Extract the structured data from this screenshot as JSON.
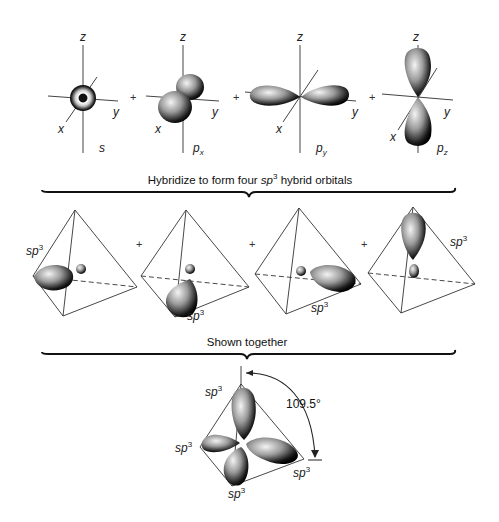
{
  "figure": {
    "row1": {
      "orbitals": [
        {
          "name": "s",
          "label": "s",
          "sub": ""
        },
        {
          "name": "px",
          "label": "p",
          "sub": "x"
        },
        {
          "name": "py",
          "label": "p",
          "sub": "y"
        },
        {
          "name": "pz",
          "label": "p",
          "sub": "z"
        }
      ],
      "axis_labels": {
        "x": "x",
        "y": "y",
        "z": "z"
      },
      "operator": "+"
    },
    "brace1": {
      "caption_pre": "Hybridize to form four ",
      "caption_sp": "sp",
      "caption_sup": "3",
      "caption_post": " hybrid orbitals"
    },
    "row2": {
      "hybrid_label": "sp",
      "hybrid_sup": "3",
      "count": 4,
      "operator": "+"
    },
    "brace2": {
      "caption": "Shown together"
    },
    "row3": {
      "hybrid_label": "sp",
      "hybrid_sup": "3",
      "angle": "109.5°"
    },
    "colors": {
      "lobe_dark": "#111111",
      "lobe_light": "#f2f2f2",
      "line": "#333333",
      "background": "#ffffff"
    }
  }
}
